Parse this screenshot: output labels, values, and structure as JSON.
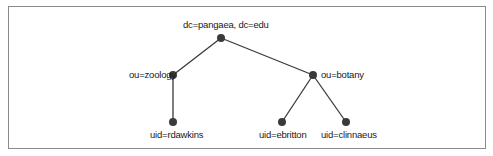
{
  "diagram": {
    "type": "tree",
    "nodes": [
      {
        "id": "root",
        "label": "dc=pangaea, dc=edu"
      },
      {
        "id": "zoology",
        "label": "ou=zoology",
        "parent": "root"
      },
      {
        "id": "botany",
        "label": "ou=botany",
        "parent": "root"
      },
      {
        "id": "rdawkins",
        "label": "uid=rdawkins",
        "parent": "zoology"
      },
      {
        "id": "ebritton",
        "label": "uid=ebritton",
        "parent": "botany"
      },
      {
        "id": "clinnaeus",
        "label": "uid=clinnaeus",
        "parent": "botany"
      }
    ],
    "colors": {
      "node": "#3a3a3a",
      "edge": "#3a3a3a",
      "border": "#8a8a8a"
    }
  }
}
